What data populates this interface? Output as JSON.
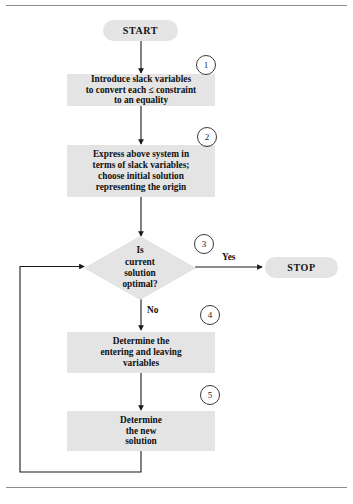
{
  "figure": {
    "type": "flowchart",
    "title_visible": false,
    "colors": {
      "node_fill": "#e4e4e4",
      "connector": "#1a1a1a",
      "rule": "#8d8d8d",
      "text": "#111111"
    }
  },
  "nodes": {
    "start": {
      "label": "START",
      "shape": "terminator"
    },
    "stop": {
      "label": "STOP",
      "shape": "terminator"
    },
    "step1": {
      "shape": "process",
      "lines": [
        "Introduce slack variables",
        "to convert each ≤ constraint",
        "to an equality"
      ]
    },
    "step2": {
      "shape": "process",
      "lines": [
        "Express above system in",
        "terms of slack variables;",
        "choose initial solution",
        "representing the origin"
      ]
    },
    "decision": {
      "shape": "decision",
      "lines": [
        "Is",
        "current",
        "solution",
        "optimal?"
      ]
    },
    "step4": {
      "shape": "process",
      "lines": [
        "Determine the",
        "entering and leaving",
        "variables"
      ]
    },
    "step5": {
      "shape": "process",
      "lines": [
        "Determine",
        "the new",
        "solution"
      ]
    }
  },
  "markers": [
    {
      "id": "marker-1",
      "label": "1"
    },
    {
      "id": "marker-2",
      "label": "2"
    },
    {
      "id": "marker-3",
      "label": "3"
    },
    {
      "id": "marker-4",
      "label": "4"
    },
    {
      "id": "marker-5",
      "label": "5"
    }
  ],
  "edge_labels": {
    "yes": "Yes",
    "no": "No"
  }
}
